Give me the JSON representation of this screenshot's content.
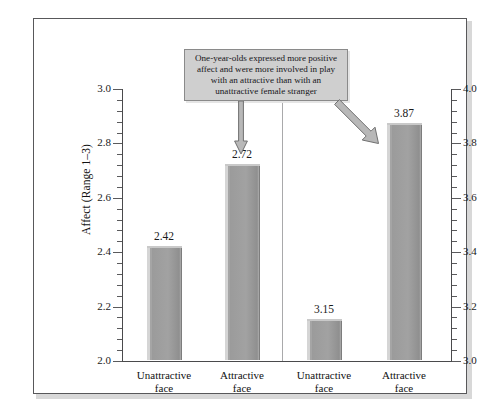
{
  "figure": {
    "annotation": "One-year-olds expressed more positive affect and were more involved in play with an attractive than with an unattractive female stranger"
  },
  "chart_data": {
    "type": "bar",
    "title": "",
    "categories": [
      "Unattractive face",
      "Attractive face",
      "Unattractive face",
      "Attractive face"
    ],
    "category_lines": [
      [
        "Unattractive",
        "face"
      ],
      [
        "Attractive",
        "face"
      ],
      [
        "Unattractive",
        "face"
      ],
      [
        "Attractive",
        "face"
      ]
    ],
    "panels": [
      {
        "name": "Affect",
        "axis": "left",
        "ylabel": "Affect (Range 1–3)",
        "ylim": [
          2.0,
          3.0
        ],
        "ticks": [
          "2.0",
          "2.2",
          "2.4",
          "2.6",
          "2.8",
          "3.0"
        ],
        "tick_values": [
          2.0,
          2.2,
          2.4,
          2.6,
          2.8,
          3.0
        ],
        "minor_tick_step": 0.04,
        "categories": [
          "Unattractive face",
          "Attractive face"
        ],
        "values": [
          2.42,
          2.72
        ],
        "value_labels": [
          "2.42",
          "2.72"
        ]
      },
      {
        "name": "Involvement in Play",
        "axis": "right",
        "ylabel": "Involvement in Play (Range 0–7)",
        "ylim": [
          3.0,
          4.0
        ],
        "ticks": [
          "3.0",
          "3.2",
          "3.4",
          "3.6",
          "3.8",
          "4.0"
        ],
        "tick_values": [
          3.0,
          3.2,
          3.4,
          3.6,
          3.8,
          4.0
        ],
        "minor_tick_step": 0.04,
        "categories": [
          "Unattractive face",
          "Attractive face"
        ],
        "values": [
          3.15,
          3.87
        ],
        "value_labels": [
          "3.15",
          "3.87"
        ]
      }
    ],
    "grid": false,
    "legend": "none",
    "bar_color": "#a2a2a2",
    "frame_color": "#58585a",
    "annotation_box_color": "#cfcfcf"
  }
}
